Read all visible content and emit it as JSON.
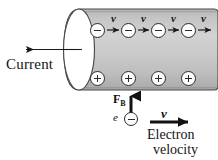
{
  "figure": {
    "background_color": "#ffffff",
    "ink_color": "#151515",
    "cylinder": {
      "name": "conductor-wire",
      "fill_color": "#c9c9c9",
      "shadow_color": "#b0b0b0",
      "highlight_color": "#dcdcdc",
      "end_cap_color": "#ffffff",
      "outline_color": "#3a3a3a"
    },
    "labels": {
      "current": "Current",
      "magnetic_force": "F",
      "magnetic_force_subscript": "B",
      "electron_symbol": "e",
      "electron_velocity_line1": "Electron",
      "electron_velocity_line2": "velocity",
      "velocity_vector": "v"
    },
    "drift_electrons": {
      "name": "drift-electron-row",
      "sign": "−",
      "count": 4,
      "velocity_labels": [
        "v",
        "v",
        "v",
        "v"
      ],
      "x_positions": [
        97,
        128,
        158,
        188
      ],
      "y": 30
    },
    "lattice_ions": {
      "name": "positive-ion-row",
      "sign": "+",
      "count": 4,
      "x_positions": [
        97,
        128,
        158,
        188
      ],
      "y": 78
    },
    "external_electron": {
      "sign": "−",
      "x": 128,
      "y": 119
    },
    "arrows": {
      "current_direction": "left",
      "drift_direction": "right",
      "force_direction": "up",
      "electron_velocity_direction": "right"
    }
  }
}
